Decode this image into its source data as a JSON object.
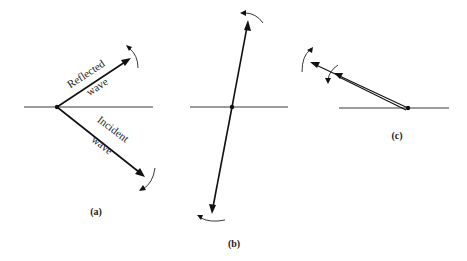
{
  "figure": {
    "panels": [
      {
        "id": "a",
        "label": "(a)",
        "vectors": [
          {
            "name": "Reflected wave",
            "text_line1": "Reflected",
            "text_line2": "wave"
          },
          {
            "name": "Incident wave",
            "text_line1": "Incident",
            "text_line2": "wave"
          }
        ]
      },
      {
        "id": "b",
        "label": "(b)"
      },
      {
        "id": "c",
        "label": "(c)"
      }
    ],
    "colors": {
      "ink": "#111111",
      "axis": "#3a3a3a",
      "background": "#ffffff"
    }
  }
}
